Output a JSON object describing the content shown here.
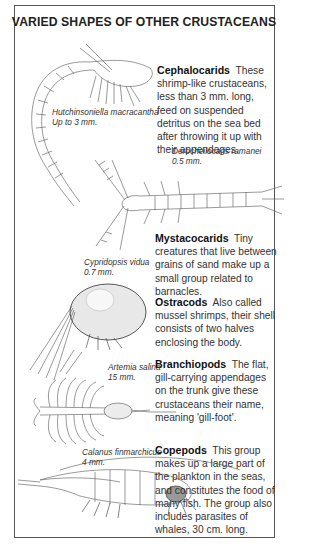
{
  "title": "VARIED SHAPES OF OTHER CRUSTACEANS",
  "sections": [
    {
      "heading": "Cephalocarids",
      "text": "These shrimp-like crustaceans, less than 3 mm. long, feed on suspended detritus on the sea bed after throwing it up with their appendages."
    },
    {
      "heading": "Mystacocarids",
      "text": "Tiny creatures that live between grains of sand make up a small group related to barnacles."
    },
    {
      "heading": "Ostracods",
      "text": "Also called mussel shrimps, their shell consists of two halves enclosing the body."
    },
    {
      "heading": "Branchiopods",
      "text": "The flat, gill-carrying appendages on the trunk give these crustaceans their name, meaning 'gill-foot'."
    },
    {
      "heading": "Copepods",
      "text": "This group makes up a large part of the plankton in the seas, and constitutes the food of many fish. The group also includes parasites of whales, 30 cm. long."
    }
  ],
  "captions": [
    {
      "species": "Hutchinsoniella macracantha",
      "size": "Up to 3 mm."
    },
    {
      "species": "Derocheilocaris ramanei",
      "size": "0.5 mm."
    },
    {
      "species": "Cypridopsis vidua",
      "size": "0.7 mm."
    },
    {
      "species": "Artemia salina",
      "size": "15 mm."
    },
    {
      "species": "Calanus finmarchicus",
      "size": "4 mm."
    }
  ],
  "illustrations": [
    {
      "icon": "cephalocarid-drawing-icon"
    },
    {
      "icon": "mystacocarid-drawing-icon"
    },
    {
      "icon": "ostracod-drawing-icon"
    },
    {
      "icon": "branchiopod-drawing-icon"
    },
    {
      "icon": "copepod-drawing-icon"
    }
  ]
}
